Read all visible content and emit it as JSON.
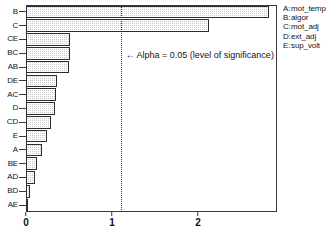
{
  "chart_data": {
    "type": "bar",
    "orientation": "horizontal",
    "title": "",
    "xlabel": "",
    "ylabel": "",
    "categories": [
      "B",
      "C",
      "CE",
      "BC",
      "AB",
      "DE",
      "AC",
      "D",
      "CD",
      "E",
      "A",
      "BE",
      "AD",
      "BD",
      "AE"
    ],
    "values": [
      2.83,
      2.13,
      0.51,
      0.51,
      0.5,
      0.36,
      0.35,
      0.34,
      0.29,
      0.24,
      0.19,
      0.13,
      0.1,
      0.05,
      0.01
    ],
    "xlim": [
      0,
      2.92
    ],
    "xticks": [
      0,
      1,
      2
    ],
    "xtick_labels": [
      "0",
      "1",
      "2"
    ],
    "grid": false,
    "bar_fill": "#c9c9c9",
    "bar_edge": "#2e2e2e",
    "reference_line": {
      "value": 1.1,
      "style": "dotted",
      "label": "Alpha = 0.05 (level of significance)",
      "arrow": "←"
    },
    "legend": {
      "position": "right",
      "entries": [
        {
          "key": "A:",
          "name": "mot_temp"
        },
        {
          "key": "B:",
          "name": "algor"
        },
        {
          "key": "C:",
          "name": "mot_adj"
        },
        {
          "key": "D:",
          "name": "ext_adj"
        },
        {
          "key": "E:",
          "name": "sup_volt"
        }
      ]
    }
  }
}
